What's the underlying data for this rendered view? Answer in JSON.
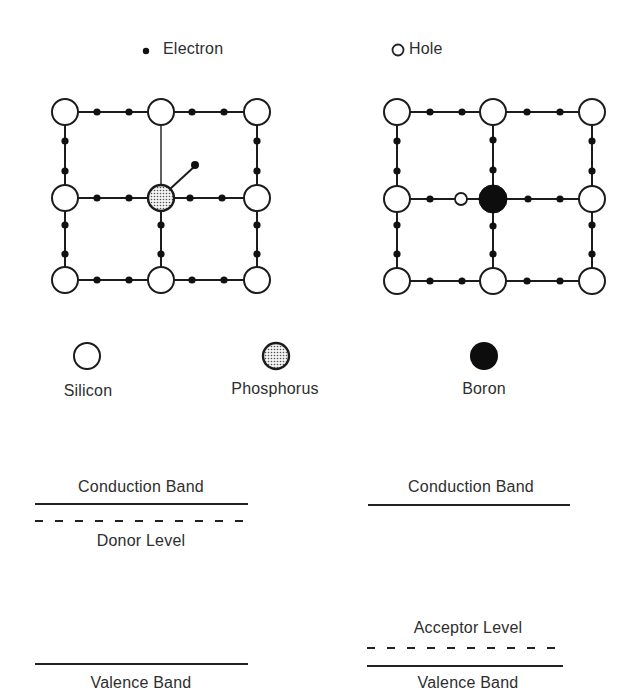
{
  "legend_top": {
    "electron_label": "Electron",
    "hole_label": "Hole"
  },
  "atom_legend": {
    "silicon": "Silicon",
    "phosphorus": "Phosphorus",
    "boron": "Boron"
  },
  "lattices": [
    {
      "name": "n-type",
      "host_atom": "Silicon",
      "dopant": "Phosphorus",
      "extra_carrier": "Electron"
    },
    {
      "name": "p-type",
      "host_atom": "Silicon",
      "dopant": "Boron",
      "extra_carrier": "Hole"
    }
  ],
  "band_diagrams": {
    "left": {
      "conduction": "Conduction Band",
      "impurity_level": "Donor Level",
      "valence": "Valence Band"
    },
    "right": {
      "conduction": "Conduction Band",
      "impurity_level": "Acceptor Level",
      "valence": "Valence Band"
    }
  },
  "colors": {
    "line": "#1c1c1c",
    "silicon_fill": "#ffffff",
    "phosphorus_fill": "#d8d8d8",
    "boron_fill": "#0d0d0d",
    "text": "#2e2e2e"
  }
}
